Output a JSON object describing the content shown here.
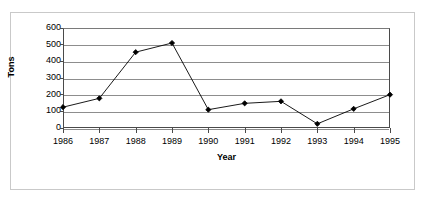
{
  "chart_data": {
    "type": "line",
    "title": "",
    "xlabel": "Year",
    "ylabel": "Tons",
    "categories": [
      "1986",
      "1987",
      "1988",
      "1989",
      "1990",
      "1991",
      "1992",
      "1993",
      "1994",
      "1995"
    ],
    "values": [
      125,
      178,
      455,
      510,
      110,
      148,
      160,
      25,
      115,
      200
    ],
    "series": [
      {
        "name": "Tons",
        "values": [
          125,
          178,
          455,
          510,
          110,
          148,
          160,
          25,
          115,
          200
        ]
      }
    ],
    "ylim": [
      0,
      600
    ],
    "yticks": [
      0,
      100,
      200,
      300,
      400,
      500,
      600
    ],
    "ytick_labels": [
      "0",
      "100",
      "200",
      "300",
      "400",
      "500",
      "600"
    ],
    "xtick_labels": [
      "1986",
      "1987",
      "1988",
      "1989",
      "1990",
      "1991",
      "1992",
      "1993",
      "1994",
      "1995"
    ],
    "grid": "horizontal",
    "legend": "none",
    "marker": "diamond",
    "line_color": "#000000",
    "marker_color": "#000000",
    "grid_color": "#8d8d8d",
    "axis_color": "#4a4a4a",
    "background_color": "#ffffff",
    "frame_color": "#c9c9c9"
  },
  "axes": {
    "y_title": "Tons",
    "x_title": "Year"
  }
}
